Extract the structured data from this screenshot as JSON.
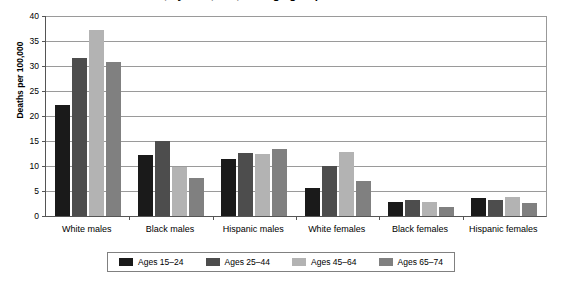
{
  "chart_data": {
    "type": "bar",
    "title": "Death rates for suicide, by race, sex, and age group",
    "xlabel": "",
    "ylabel": "Deaths per 100,000",
    "ylim": [
      0,
      40
    ],
    "ytick_step": 5,
    "yticks": [
      40,
      35,
      30,
      25,
      20,
      15,
      10,
      5,
      0
    ],
    "grid": true,
    "legend_position": "bottom",
    "categories": [
      "White males",
      "Black males",
      "Hispanic males",
      "White females",
      "Black females",
      "Hispanic females"
    ],
    "series": [
      {
        "name": "Ages 15–24",
        "color": "#1a1a1a",
        "values": [
          22.3,
          12.3,
          11.5,
          5.6,
          2.9,
          3.7
        ]
      },
      {
        "name": "Ages 25–44",
        "color": "#4d4d4d",
        "values": [
          31.7,
          15.0,
          12.6,
          10.1,
          3.2,
          3.3
        ]
      },
      {
        "name": "Ages 45–64",
        "color": "#b3b3b3",
        "values": [
          37.2,
          9.9,
          12.5,
          12.8,
          2.9,
          3.8
        ]
      },
      {
        "name": "Ages 65–74",
        "color": "#808080",
        "values": [
          30.8,
          7.7,
          13.4,
          7.0,
          1.8,
          2.7
        ]
      }
    ]
  },
  "axis": {
    "y_title": "Deaths per 100,000"
  },
  "colors": {
    "gridline": "#9a9a9a",
    "axis": "#555555",
    "legend_border": "#808080",
    "background": "#ffffff"
  }
}
